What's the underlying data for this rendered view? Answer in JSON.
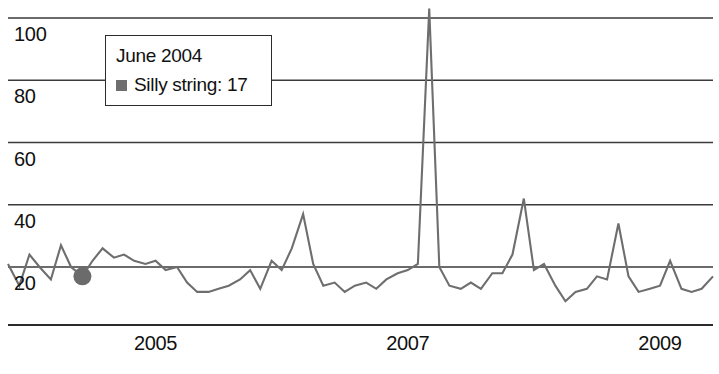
{
  "chart_data": {
    "type": "line",
    "title": "",
    "xlabel": "",
    "ylabel": "",
    "grid": true,
    "legend_position": "none",
    "xlim": [
      2003.83,
      2009.42
    ],
    "ylim": [
      0,
      108
    ],
    "y_ticks": [
      100,
      80,
      60,
      40,
      20
    ],
    "x_ticks": [
      2005,
      2007,
      2009
    ],
    "series": [
      {
        "name": "Silly string",
        "color": "#6e6e6e",
        "x": [
          2003.83,
          2003.92,
          2004.0,
          2004.08,
          2004.17,
          2004.25,
          2004.33,
          2004.42,
          2004.5,
          2004.58,
          2004.67,
          2004.75,
          2004.83,
          2004.92,
          2005.0,
          2005.08,
          2005.17,
          2005.25,
          2005.33,
          2005.42,
          2005.5,
          2005.58,
          2005.67,
          2005.75,
          2005.83,
          2005.92,
          2006.0,
          2006.08,
          2006.17,
          2006.25,
          2006.33,
          2006.42,
          2006.5,
          2006.58,
          2006.67,
          2006.75,
          2006.83,
          2006.92,
          2007.0,
          2007.08,
          2007.17,
          2007.25,
          2007.33,
          2007.42,
          2007.5,
          2007.58,
          2007.67,
          2007.75,
          2007.83,
          2007.92,
          2008.0,
          2008.08,
          2008.17,
          2008.25,
          2008.33,
          2008.42,
          2008.5,
          2008.58,
          2008.67,
          2008.75,
          2008.83,
          2008.92,
          2009.0,
          2009.08,
          2009.17,
          2009.25,
          2009.33,
          2009.42
        ],
        "values": [
          21,
          14,
          24,
          20,
          16,
          27,
          20,
          17,
          22,
          26,
          23,
          24,
          22,
          21,
          22,
          19,
          20,
          15,
          12,
          12,
          13,
          14,
          16,
          19,
          13,
          22,
          19,
          26,
          37,
          21,
          14,
          15,
          12,
          14,
          15,
          13,
          16,
          18,
          19,
          21,
          103,
          20,
          14,
          13,
          15,
          13,
          18,
          18,
          24,
          42,
          19,
          21,
          14,
          9,
          12,
          13,
          17,
          16,
          34,
          17,
          12,
          13,
          14,
          22,
          13,
          12,
          13,
          17
        ]
      }
    ],
    "highlighted_point": {
      "label": "June 2004",
      "series_name": "Silly string",
      "value": 17,
      "x": 2004.42
    }
  },
  "tooltip": {
    "title": "June 2004",
    "series_line": "Silly string: 17",
    "swatch_color": "#6e6e6e"
  },
  "axes": {
    "y_labels": [
      "100",
      "80",
      "60",
      "40",
      "20"
    ],
    "x_labels": [
      "2005",
      "2007",
      "2009"
    ]
  }
}
